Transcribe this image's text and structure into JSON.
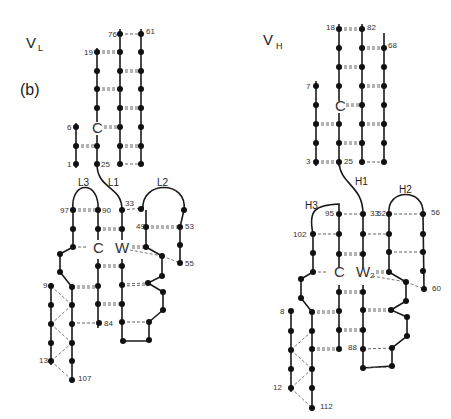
{
  "figure": {
    "panel_label": "(b)",
    "domains": [
      {
        "id": "VL",
        "title_main": "V",
        "title_sub": "L",
        "title_pos": [
          26,
          48
        ],
        "loops": [
          "L1",
          "L2",
          "L3"
        ],
        "residue_letters": [
          "C",
          "C",
          "W"
        ],
        "numbers": [
          "76",
          "61",
          "19",
          "6",
          "1",
          "25",
          "97",
          "90",
          "33",
          "49",
          "53",
          "55",
          "9",
          "84",
          "13",
          "107"
        ]
      },
      {
        "id": "VH",
        "title_main": "V",
        "title_sub": "H",
        "title_pos": [
          263,
          45
        ],
        "loops": [
          "H1",
          "H2",
          "H3"
        ],
        "residue_letters": [
          "C",
          "C",
          "W2"
        ],
        "numbers": [
          "18",
          "82",
          "68",
          "7",
          "3",
          "25",
          "95",
          "33",
          "52",
          "56",
          "102",
          "60",
          "8",
          "88",
          "12",
          "112"
        ]
      }
    ],
    "labels": [
      {
        "t": "76",
        "x": 108,
        "y": 37
      },
      {
        "t": "61",
        "x": 146,
        "y": 34
      },
      {
        "t": "19",
        "x": 84,
        "y": 55
      },
      {
        "t": "6",
        "x": 67,
        "y": 130
      },
      {
        "t": "1",
        "x": 67,
        "y": 167
      },
      {
        "t": "25",
        "x": 101,
        "y": 167
      },
      {
        "t": "L3",
        "x": 78,
        "y": 186
      },
      {
        "t": "L1",
        "x": 108,
        "y": 186
      },
      {
        "t": "L2",
        "x": 157,
        "y": 186
      },
      {
        "t": "97",
        "x": 60,
        "y": 213
      },
      {
        "t": "90",
        "x": 102,
        "y": 213
      },
      {
        "t": "33",
        "x": 125,
        "y": 206
      },
      {
        "t": "49",
        "x": 136,
        "y": 229
      },
      {
        "t": "53",
        "x": 185,
        "y": 229
      },
      {
        "t": "55",
        "x": 185,
        "y": 266
      },
      {
        "t": "9",
        "x": 43,
        "y": 288
      },
      {
        "t": "84",
        "x": 104,
        "y": 326
      },
      {
        "t": "13",
        "x": 39,
        "y": 363
      },
      {
        "t": "107",
        "x": 78,
        "y": 381
      },
      {
        "t": "18",
        "x": 326,
        "y": 30
      },
      {
        "t": "82",
        "x": 367,
        "y": 30
      },
      {
        "t": "68",
        "x": 388,
        "y": 48
      },
      {
        "t": "7",
        "x": 306,
        "y": 89
      },
      {
        "t": "3",
        "x": 306,
        "y": 164
      },
      {
        "t": "25",
        "x": 344,
        "y": 164
      },
      {
        "t": "H1",
        "x": 355,
        "y": 185
      },
      {
        "t": "H2",
        "x": 399,
        "y": 193
      },
      {
        "t": "H3",
        "x": 305,
        "y": 209
      },
      {
        "t": "95",
        "x": 325,
        "y": 216
      },
      {
        "t": "33",
        "x": 370,
        "y": 216
      },
      {
        "t": "52",
        "x": 377,
        "y": 216
      },
      {
        "t": "56",
        "x": 431,
        "y": 215
      },
      {
        "t": "102",
        "x": 293,
        "y": 237
      },
      {
        "t": "60",
        "x": 432,
        "y": 291
      },
      {
        "t": "8",
        "x": 280,
        "y": 314
      },
      {
        "t": "88",
        "x": 348,
        "y": 350
      },
      {
        "t": "12",
        "x": 273,
        "y": 390
      },
      {
        "t": "112",
        "x": 320,
        "y": 409
      }
    ],
    "letters": [
      {
        "t": "C",
        "x": 92,
        "y": 133
      },
      {
        "t": "C",
        "x": 93,
        "y": 253
      },
      {
        "t": "W",
        "x": 115,
        "y": 253
      },
      {
        "t": "C",
        "x": 335,
        "y": 111
      },
      {
        "t": "C",
        "x": 334,
        "y": 277
      },
      {
        "t": "W",
        "x": 356,
        "y": 277
      },
      {
        "t": "2",
        "x": 370,
        "y": 278
      }
    ]
  }
}
